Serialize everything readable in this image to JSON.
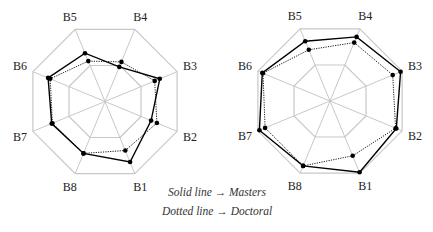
{
  "chart_data": [
    {
      "type": "radar",
      "title": "",
      "axes": [
        "B1",
        "B2",
        "B3",
        "B4",
        "B5",
        "B6",
        "B7",
        "B8"
      ],
      "range": [
        0,
        1
      ],
      "grid_rings": [
        0.5,
        1.0
      ],
      "series": [
        {
          "name": "Masters",
          "style": "solid",
          "values": [
            0.84,
            0.64,
            0.76,
            0.48,
            0.67,
            0.79,
            0.74,
            0.72
          ]
        },
        {
          "name": "Doctoral",
          "style": "dotted",
          "values": [
            0.68,
            0.72,
            0.69,
            0.55,
            0.56,
            0.76,
            0.73,
            0.72
          ]
        }
      ]
    },
    {
      "type": "radar",
      "title": "",
      "axes": [
        "B1",
        "B2",
        "B3",
        "B4",
        "B5",
        "B6",
        "B7",
        "B8"
      ],
      "range": [
        0,
        1
      ],
      "grid_rings": [
        0.5,
        1.0
      ],
      "series": [
        {
          "name": "Masters",
          "style": "solid",
          "values": [
            0.99,
            0.92,
            0.98,
            0.89,
            0.83,
            0.94,
            0.98,
            0.9
          ]
        },
        {
          "name": "Doctoral",
          "style": "dotted",
          "values": [
            0.76,
            0.91,
            0.87,
            0.81,
            0.71,
            0.93,
            0.9,
            0.9
          ]
        }
      ]
    }
  ],
  "legend": {
    "line1": "Solid line → Masters",
    "line2": "Dotted line → Doctoral"
  },
  "colors": {
    "grid": "#c8c8c8",
    "series": "#000000",
    "label": "#222222"
  }
}
